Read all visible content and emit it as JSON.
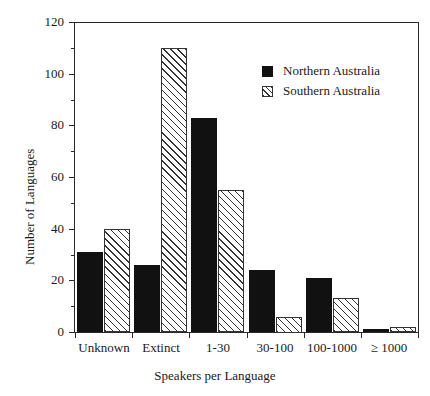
{
  "chart_data": {
    "type": "bar",
    "title": "",
    "xlabel": "Speakers per Language",
    "ylabel": "Number of Languages",
    "categories": [
      "Unknown",
      "Extinct",
      "1-30",
      "30-100",
      "100-1000",
      "≥ 1000"
    ],
    "series": [
      {
        "name": "Northern Australia",
        "values": [
          31,
          26,
          83,
          24,
          21,
          1
        ],
        "style": "solid-black",
        "color": "#111111"
      },
      {
        "name": "Southern Australia",
        "values": [
          40,
          110,
          55,
          6,
          13,
          2
        ],
        "style": "diagonal-hatch",
        "color": "#333333"
      }
    ],
    "ylim": [
      0,
      120
    ],
    "yticks": [
      0,
      20,
      40,
      60,
      80,
      100,
      120
    ],
    "ytick_labels": [
      "0",
      "20",
      "40",
      "60",
      "80",
      "100",
      "120"
    ],
    "yminor_interval": 10,
    "grid": false,
    "legend_position": "top-right"
  },
  "legend": {
    "entries": [
      {
        "label": "Northern Australia"
      },
      {
        "label": "Southern Australia"
      }
    ]
  }
}
